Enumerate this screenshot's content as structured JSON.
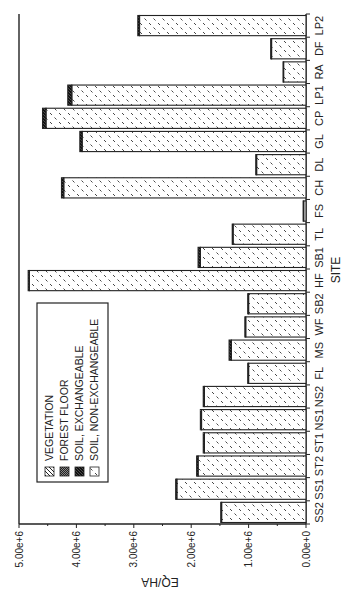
{
  "chart_data": {
    "type": "bar",
    "stacked": true,
    "orientation": "rotated-90-ccw",
    "title": "",
    "xlabel": "SITE",
    "ylabel": "EQ/HA",
    "ylim": [
      0,
      5000000
    ],
    "yticks": [
      0,
      1000000,
      2000000,
      3000000,
      4000000,
      5000000
    ],
    "ytick_labels": [
      "0.00e+0",
      "1.00e+6",
      "2.00e+6",
      "3.00e+6",
      "4.00e+6",
      "5.00e+6"
    ],
    "categories": [
      "SS2",
      "SS1",
      "ST2",
      "ST1",
      "NS1",
      "NS2",
      "FL",
      "MS",
      "WF",
      "SB2",
      "HF",
      "SB1",
      "TL",
      "FS",
      "CH",
      "DL",
      "GL",
      "CP",
      "LP1",
      "RA",
      "DF",
      "LP2"
    ],
    "series": [
      {
        "name": "VEGETATION",
        "pattern": "diagonal-hatch",
        "values": [
          0,
          0,
          0,
          0,
          0,
          0,
          0,
          0,
          0,
          0,
          0,
          0,
          0,
          0,
          0,
          0,
          0,
          0,
          0,
          0,
          0,
          0
        ]
      },
      {
        "name": "FOREST FLOOR",
        "pattern": "dense-crosshatch",
        "values": [
          0,
          0,
          0,
          0,
          0,
          0,
          0,
          0,
          0,
          0,
          0,
          0,
          0,
          0,
          0,
          0,
          0,
          0,
          0,
          0,
          0,
          0
        ]
      },
      {
        "name": "SOIL, NON-EXCHANGEABLE",
        "pattern": "sparse-dash",
        "values": [
          1470000,
          2250000,
          1880000,
          1770000,
          1820000,
          1770000,
          1000000,
          1300000,
          1050000,
          1000000,
          4820000,
          1840000,
          1270000,
          40000,
          4220000,
          860000,
          3900000,
          4530000,
          4080000,
          390000,
          600000,
          2900000
        ]
      },
      {
        "name": "SOIL, EXCHANGEABLE",
        "pattern": "dark-hatch",
        "values": [
          15000,
          20000,
          25000,
          20000,
          20000,
          20000,
          15000,
          40000,
          15000,
          15000,
          20000,
          40000,
          15000,
          10000,
          40000,
          15000,
          40000,
          60000,
          70000,
          10000,
          15000,
          30000
        ]
      }
    ],
    "legend": {
      "placement": "upper-left",
      "entries": [
        "VEGETATION",
        "FOREST FLOOR",
        "SOIL, EXCHANGEABLE",
        "SOIL, NON-EXCHANGEABLE"
      ]
    },
    "grid": false
  }
}
